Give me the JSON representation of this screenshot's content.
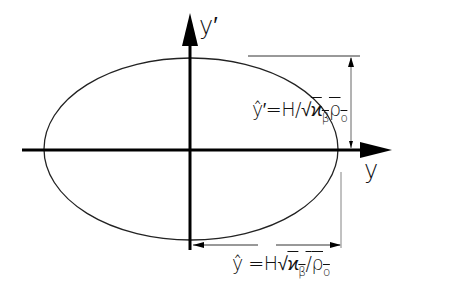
{
  "diagram": {
    "axes": {
      "horizontal_label": "y",
      "vertical_label": "y′"
    },
    "ellipse": {
      "cx": 191,
      "cy": 149,
      "rx": 147,
      "ry": 91
    },
    "annotations": {
      "vertical_extent": {
        "lhs": "ŷ′",
        "eq": "=H/",
        "sqrt": "√",
        "kappa": "ϰ",
        "kappa_sub": "β",
        "rho": "ρ",
        "rho_sub": "o"
      },
      "horizontal_extent": {
        "lhs": "ŷ",
        "eq": " =H",
        "sqrt": "√",
        "kappa": "ϰ",
        "kappa_sub": "β",
        "slash": "/",
        "rho": "ρ",
        "rho_sub": "o"
      }
    },
    "colors": {
      "line": "#111111",
      "thin": "#333333",
      "background": "#ffffff"
    }
  }
}
